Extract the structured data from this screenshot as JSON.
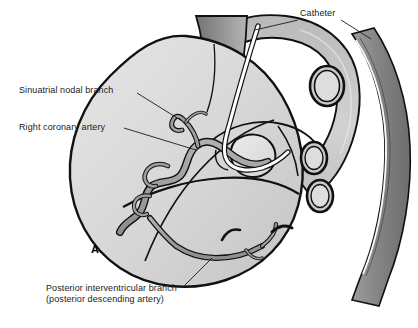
{
  "figure": {
    "kind": "anatomical-illustration",
    "panel_letter": "A",
    "background_color": "#ffffff"
  },
  "labels": {
    "sinuatrial": "Sinuatrial nodal branch",
    "right_coronary_artery": "Right coronary artery",
    "catheter": "Catheter",
    "posterior_interventricular_line1": "Posterior interventricular branch",
    "posterior_interventricular_line2": "(posterior descending artery)"
  },
  "colors": {
    "outline": "#111111",
    "heart_fill_light": "#d9d9d9",
    "heart_fill_mid": "#cccccc",
    "chamber_fill": "#e2e2e2",
    "vessel_gray": "#9a9a9a",
    "aorta_gray": "#8a8a8a",
    "aorta_dark": "#6e6e6e",
    "vena_cava_dark": "#707070",
    "catheter_white": "#ffffff",
    "label_text": "#1a1a1a",
    "leader_line": "#1a1a1a"
  },
  "structures": [
    {
      "name": "descending-aorta",
      "fill": "#8a8a8a",
      "note": "broad gray band arcing down the right side"
    },
    {
      "name": "aortic-arch",
      "fill": "#cccccc",
      "note": "arch curving over the top right of the heart"
    },
    {
      "name": "superior-vena-cava",
      "fill": "#909090",
      "note": "vertical vessel entering top of heart"
    },
    {
      "name": "heart-body",
      "fill": "#d9d9d9",
      "note": "large rounded posterior heart silhouette"
    },
    {
      "name": "right-coronary-artery",
      "fill": "#9a9a9a",
      "note": "tortuous vessel in atrioventricular groove"
    },
    {
      "name": "sinuatrial-nodal-branch",
      "fill": "#9a9a9a",
      "note": "small branch ascending to the atrium"
    },
    {
      "name": "posterior-interventricular-branch",
      "fill": "#9a9a9a",
      "note": "vessel descending across the lower heart"
    },
    {
      "name": "catheter-tube",
      "fill": "#ffffff",
      "note": "white tube running from the aorta into the coronary ostium"
    },
    {
      "name": "vessel-cross-section-1",
      "fill": "#cfcfcf",
      "note": "upper oval vessel opening"
    },
    {
      "name": "vessel-cross-section-2",
      "fill": "#cfcfcf",
      "note": "middle oval vessel opening"
    },
    {
      "name": "vessel-cross-section-3",
      "fill": "#cfcfcf",
      "note": "lower oval vessel opening"
    }
  ],
  "leader_lines": [
    {
      "name": "sinuatrial-leader",
      "from": "Sinuatrial nodal branch label",
      "to": "sinuatrial nodal branch vessel"
    },
    {
      "name": "rca-leader",
      "from": "Right coronary artery label",
      "to": "right coronary artery trunk"
    },
    {
      "name": "catheter-leader-left",
      "from": "Catheter label",
      "to": "catheter within aortic arch"
    },
    {
      "name": "catheter-leader-right",
      "from": "Catheter label",
      "to": "catheter within descending aorta"
    },
    {
      "name": "pib-leader",
      "from": "Posterior interventricular branch label",
      "to": "posterior interventricular branch vessel"
    }
  ]
}
